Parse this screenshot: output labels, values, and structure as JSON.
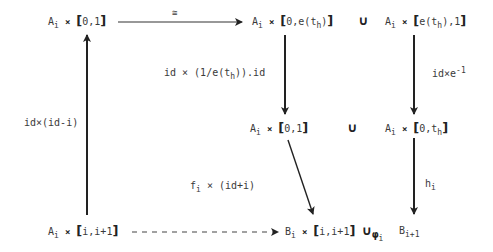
{
  "diagram": {
    "nodes": {
      "top_left": {
        "set": "A",
        "sub": "i",
        "interval": "0,1"
      },
      "top_mid": {
        "set": "A",
        "sub": "i",
        "interval_a": "0,e(t",
        "interval_sub": "h",
        "interval_b": ")"
      },
      "top_right": {
        "set": "A",
        "sub": "i",
        "interval_a": "e(t",
        "interval_sub": "h",
        "interval_b": "),1"
      },
      "mid_mid": {
        "set": "A",
        "sub": "i",
        "interval": "0,1"
      },
      "mid_right": {
        "set": "A",
        "sub": "i",
        "interval_a": "0,t",
        "interval_sub": "h"
      },
      "bottom_left": {
        "set": "A",
        "sub": "i",
        "interval": "i,i+1"
      },
      "bottom_mid": {
        "set": "B",
        "sub": "i",
        "interval": "i,i+1",
        "glue": "∪",
        "glue_sub": "φ",
        "glue_subsub": "i"
      },
      "bottom_right": {
        "set": "B",
        "sub": "i+1"
      }
    },
    "union_symbol": "∪",
    "times_symbol": "×",
    "arrows": {
      "top_horizontal": {
        "label": "≅"
      },
      "top_mid_down": {
        "label_a": "id × (1/e(t",
        "label_sub": "h",
        "label_b": ")).id"
      },
      "top_right_down": {
        "label_a": "id×e",
        "label_sup": "-1"
      },
      "left_up": {
        "label": "id×(id-i)"
      },
      "mid_diagonal": {
        "label_a": "f",
        "label_sub": "i",
        "label_b": " × (id+i)"
      },
      "mid_right_down": {
        "label": "h",
        "label_sub": "i"
      },
      "bottom_dashed": {
        "label": ""
      }
    }
  }
}
